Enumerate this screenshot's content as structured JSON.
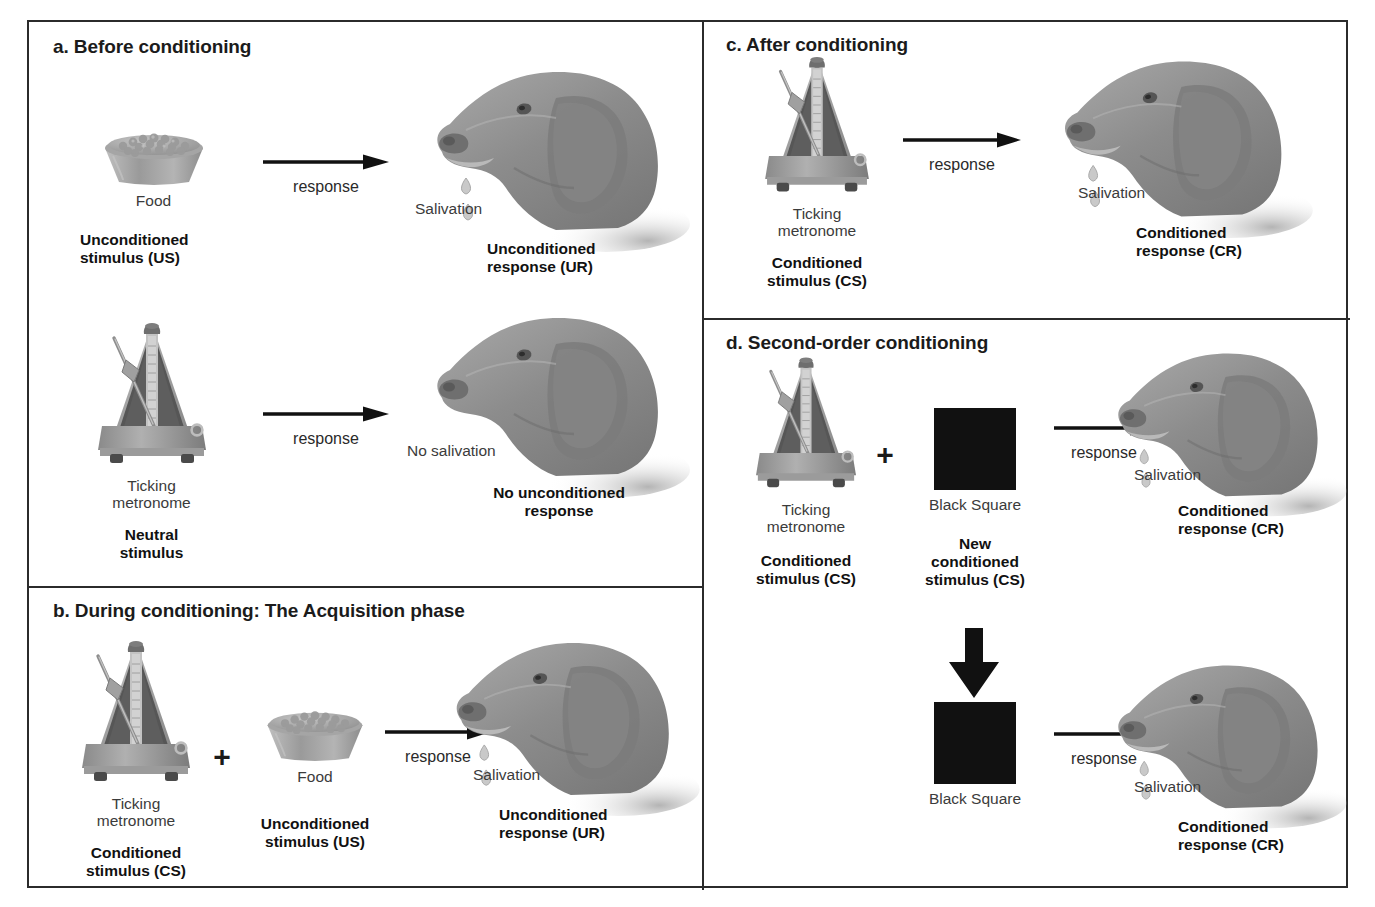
{
  "figure": {
    "panels": [
      {
        "id": "a",
        "title": "a. Before conditioning",
        "rows": [
          {
            "stimulus_name": "Food",
            "stimulus_role": [
              "Unconditioned",
              "stimulus (US)"
            ],
            "arrow_label": "response",
            "response_name": "Salivation",
            "response_role": [
              "Unconditioned",
              "response (UR)"
            ]
          },
          {
            "stimulus_name": [
              "Ticking",
              "metronome"
            ],
            "stimulus_role": [
              "Neutral",
              "stimulus"
            ],
            "arrow_label": "response",
            "response_name": "No salivation",
            "response_role": [
              "No unconditioned",
              "response"
            ]
          }
        ]
      },
      {
        "id": "b",
        "title": "b. During conditioning: The Acquisition phase",
        "rows": [
          {
            "stimulus_name": [
              "Ticking",
              "metronome"
            ],
            "stimulus_role": [
              "Conditioned",
              "stimulus (CS)"
            ],
            "plus": "+",
            "stimulus2_name": "Food",
            "stimulus2_role": [
              "Unconditioned",
              "stimulus (US)"
            ],
            "arrow_label": "response",
            "response_name": "Salivation",
            "response_role": [
              "Unconditioned",
              "response (UR)"
            ]
          }
        ]
      },
      {
        "id": "c",
        "title": "c. After conditioning",
        "rows": [
          {
            "stimulus_name": [
              "Ticking",
              "metronome"
            ],
            "stimulus_role": [
              "Conditioned",
              "stimulus (CS)"
            ],
            "arrow_label": "response",
            "response_name": "Salivation",
            "response_role": [
              "Conditioned",
              "response (CR)"
            ]
          }
        ]
      },
      {
        "id": "d",
        "title": "d. Second-order conditioning",
        "rows": [
          {
            "stimulus_name": [
              "Ticking",
              "metronome"
            ],
            "stimulus_role": [
              "Conditioned",
              "stimulus (CS)"
            ],
            "plus": "+",
            "stimulus2_name": "Black Square",
            "stimulus2_role": [
              "New",
              "conditioned",
              "stimulus (CS)"
            ],
            "arrow_label": "response",
            "response_name": "Salivation",
            "response_role": [
              "Conditioned",
              "response (CR)"
            ]
          },
          {
            "stimulus_name": "Black Square",
            "arrow_label": "response",
            "response_name": "Salivation",
            "response_role": [
              "Conditioned",
              "response (CR)"
            ]
          }
        ]
      }
    ],
    "icons": {
      "metronome": "metronome-icon",
      "bowl": "food-bowl-icon",
      "dog": "dog-head-icon",
      "black_square": "black-square-icon",
      "arrow_right": "arrow-right-icon",
      "arrow_down": "arrow-down-icon",
      "plus": "plus-icon",
      "drop": "saliva-drop-icon"
    },
    "colors": {
      "border": "#2b2b2b",
      "black_square": "#111111",
      "metronome_body": "#a8a8a8",
      "metronome_cavity": "#5c5c5c",
      "dog_fill": "#8e8e8e",
      "text": "#1b1b1b"
    }
  }
}
